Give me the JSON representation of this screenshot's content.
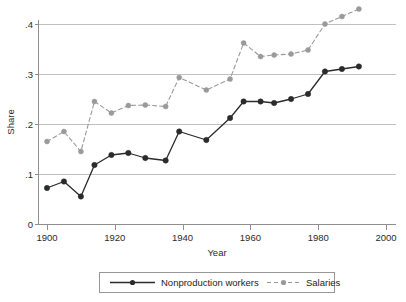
{
  "chart_data": {
    "type": "line",
    "title": "",
    "xlabel": "Year",
    "ylabel": "Share",
    "xlim": [
      1895,
      2001
    ],
    "ylim": [
      0,
      0.45
    ],
    "grid": true,
    "legend_position": "bottom",
    "x_ticks": [
      1900,
      1920,
      1940,
      1960,
      1980,
      2000
    ],
    "x_tick_labels": [
      "1900",
      "1920",
      "1940",
      "1960",
      "1980",
      "2000"
    ],
    "y_ticks": [
      0,
      0.1,
      0.2,
      0.3,
      0.4
    ],
    "y_tick_labels": [
      "0",
      ".1",
      ".2",
      ".3",
      ".4"
    ],
    "x": [
      1900,
      1905,
      1910,
      1914,
      1919,
      1924,
      1929,
      1935,
      1939,
      1947,
      1954,
      1958,
      1963,
      1967,
      1972,
      1977,
      1982,
      1987,
      1992
    ],
    "series": [
      {
        "name": "Nonproduction workers",
        "style": "solid",
        "color": "#2b2b2b",
        "marker": "filled-circle",
        "values": [
          0.072,
          0.085,
          0.055,
          0.118,
          0.138,
          0.142,
          0.132,
          0.127,
          0.185,
          0.168,
          0.212,
          0.245,
          0.245,
          0.242,
          0.25,
          0.26,
          0.305,
          0.31,
          0.315
        ]
      },
      {
        "name": "Salaries",
        "style": "dashed",
        "color": "#9a9a9a",
        "marker": "filled-circle",
        "values": [
          0.165,
          0.185,
          0.145,
          0.245,
          0.222,
          0.237,
          0.238,
          0.235,
          0.293,
          0.268,
          0.29,
          0.362,
          0.335,
          0.338,
          0.34,
          0.348,
          0.4,
          0.415,
          0.43
        ]
      }
    ]
  },
  "legend": {
    "items": [
      {
        "label": "Nonproduction workers",
        "style": "solid",
        "color": "#2b2b2b"
      },
      {
        "label": "Salaries",
        "style": "dashed",
        "color": "#9a9a9a"
      }
    ]
  }
}
